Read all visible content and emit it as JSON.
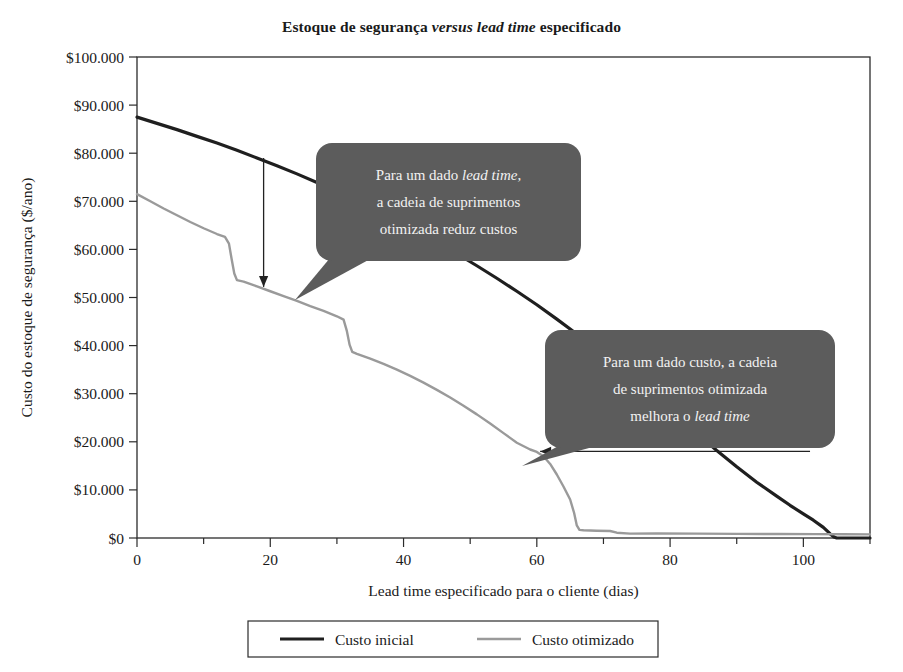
{
  "chart_data": {
    "type": "line",
    "title": "Estoque de segurança versus lead time especificado",
    "title_parts": [
      {
        "text": "Estoque de segurança ",
        "italic": false
      },
      {
        "text": "versus lead time",
        "italic": true
      },
      {
        "text": " especificado",
        "italic": false
      }
    ],
    "xlabel": "Lead time especificado para o cliente (dias)",
    "xlabel_parts": [
      {
        "text": "Lead time",
        "italic": true
      },
      {
        "text": " especificado para o cliente (dias)",
        "italic": false
      }
    ],
    "ylabel": "Custo do estoque de segurança ($/ano)",
    "xlim": [
      0,
      110
    ],
    "ylim": [
      0,
      100000
    ],
    "grid": false,
    "legend_position": "bottom",
    "x_ticks": [
      0,
      20,
      40,
      60,
      80,
      100
    ],
    "x_tick_labels": [
      "0",
      "20",
      "40",
      "60",
      "80",
      "100"
    ],
    "x_minor_ticks": [
      10,
      30,
      50,
      70,
      90,
      110
    ],
    "y_ticks": [
      0,
      10000,
      20000,
      30000,
      40000,
      50000,
      60000,
      70000,
      80000,
      90000,
      100000
    ],
    "y_tick_labels": [
      "$0",
      "$10.000",
      "$20.000",
      "$30.000",
      "$40.000",
      "$50.000",
      "$60.000",
      "$70.000",
      "$80.000",
      "$90.000",
      "$100.000"
    ],
    "series": [
      {
        "name": "Custo inicial",
        "color": "#1f1f1f",
        "width": 3.2,
        "points": [
          [
            0,
            87500
          ],
          [
            3,
            86200
          ],
          [
            6,
            84900
          ],
          [
            9,
            83500
          ],
          [
            12,
            82100
          ],
          [
            15,
            80600
          ],
          [
            18,
            79000
          ],
          [
            21,
            77400
          ],
          [
            24,
            75700
          ],
          [
            27,
            73900
          ],
          [
            30,
            72000
          ],
          [
            33,
            70100
          ],
          [
            36,
            68100
          ],
          [
            39,
            66000
          ],
          [
            42,
            63800
          ],
          [
            45,
            61500
          ],
          [
            48,
            59100
          ],
          [
            51,
            56600
          ],
          [
            54,
            54000
          ],
          [
            57,
            51300
          ],
          [
            60,
            48500
          ],
          [
            63,
            45500
          ],
          [
            66,
            42400
          ],
          [
            69,
            39200
          ],
          [
            72,
            35900
          ],
          [
            75,
            32500
          ],
          [
            78,
            29000
          ],
          [
            81,
            25400
          ],
          [
            84,
            21800
          ],
          [
            87,
            18200
          ],
          [
            90,
            14800
          ],
          [
            93,
            11600
          ],
          [
            96,
            8700
          ],
          [
            98,
            6800
          ],
          [
            100,
            5000
          ],
          [
            101.5,
            3700
          ],
          [
            103,
            2200
          ],
          [
            104,
            900
          ],
          [
            104.6,
            200
          ],
          [
            105,
            0
          ],
          [
            110,
            0
          ]
        ]
      },
      {
        "name": "Custo otimizado",
        "color": "#9a9a9a",
        "width": 2.4,
        "points": [
          [
            0,
            71500
          ],
          [
            2,
            70000
          ],
          [
            4,
            68500
          ],
          [
            6,
            67100
          ],
          [
            8,
            65700
          ],
          [
            10,
            64400
          ],
          [
            12,
            63200
          ],
          [
            13.2,
            62600
          ],
          [
            13.8,
            61200
          ],
          [
            14.2,
            58000
          ],
          [
            14.6,
            55000
          ],
          [
            15,
            53600
          ],
          [
            16,
            53300
          ],
          [
            18,
            52300
          ],
          [
            20,
            51300
          ],
          [
            22,
            50300
          ],
          [
            24,
            49300
          ],
          [
            26,
            48200
          ],
          [
            28,
            47200
          ],
          [
            30,
            46100
          ],
          [
            31,
            45400
          ],
          [
            31.5,
            43000
          ],
          [
            31.9,
            40200
          ],
          [
            32.3,
            38700
          ],
          [
            33,
            38300
          ],
          [
            35,
            37300
          ],
          [
            37,
            36200
          ],
          [
            39,
            35000
          ],
          [
            41,
            33700
          ],
          [
            43,
            32300
          ],
          [
            45,
            30800
          ],
          [
            47,
            29200
          ],
          [
            49,
            27500
          ],
          [
            51,
            25700
          ],
          [
            53,
            23800
          ],
          [
            55,
            21800
          ],
          [
            57,
            19800
          ],
          [
            59,
            18400
          ],
          [
            60,
            17900
          ],
          [
            61,
            17000
          ],
          [
            62,
            15400
          ],
          [
            63,
            13200
          ],
          [
            64,
            10700
          ],
          [
            65,
            8000
          ],
          [
            65.6,
            5200
          ],
          [
            66,
            2600
          ],
          [
            66.4,
            1700
          ],
          [
            67,
            1600
          ],
          [
            69,
            1500
          ],
          [
            71,
            1450
          ],
          [
            72,
            1100
          ],
          [
            74,
            900
          ],
          [
            78,
            950
          ],
          [
            84,
            900
          ],
          [
            90,
            850
          ],
          [
            96,
            820
          ],
          [
            102,
            800
          ],
          [
            106,
            780
          ],
          [
            110,
            760
          ]
        ]
      }
    ],
    "annotations": [
      {
        "id": "callout-cost-reduction",
        "text": "Para um dado lead time, a cadeia de suprimentos otimizada reduz custos",
        "lines": [
          [
            {
              "text": "Para um dado ",
              "italic": false
            },
            {
              "text": "lead time",
              "italic": true
            },
            {
              "text": ",",
              "italic": false
            }
          ],
          [
            {
              "text": "a cadeia de suprimentos",
              "italic": false
            }
          ],
          [
            {
              "text": "otimizada reduz custos",
              "italic": false
            }
          ]
        ],
        "box_color": "#5c5c5c",
        "text_color": "#f2f2f2"
      },
      {
        "id": "callout-leadtime-improvement",
        "text": "Para um dado custo, a cadeia de suprimentos otimizada melhora o lead time",
        "lines": [
          [
            {
              "text": "Para um dado custo, a cadeia",
              "italic": false
            }
          ],
          [
            {
              "text": "de suprimentos otimizada",
              "italic": false
            }
          ],
          [
            {
              "text": "melhora o ",
              "italic": false
            },
            {
              "text": "lead time",
              "italic": true
            }
          ]
        ],
        "box_color": "#5c5c5c",
        "text_color": "#f2f2f2"
      }
    ],
    "arrows": [
      {
        "id": "vertical-cost-arrow",
        "orientation": "vertical",
        "from": [
          19,
          79000
        ],
        "to": [
          19,
          52200
        ],
        "note": "Queda de custo para lead time fixo de 19 dias"
      },
      {
        "id": "horizontal-leadtime-arrow",
        "orientation": "horizontal",
        "from": [
          101,
          18000
        ],
        "to": [
          60.5,
          18000
        ],
        "note": "Reducao de lead time para custo fixo de $18.000"
      }
    ]
  },
  "legend": {
    "items": [
      {
        "label": "Custo inicial",
        "color": "#1f1f1f",
        "width": 3.2
      },
      {
        "label": "Custo otimizado",
        "color": "#9a9a9a",
        "width": 2.4
      }
    ]
  }
}
